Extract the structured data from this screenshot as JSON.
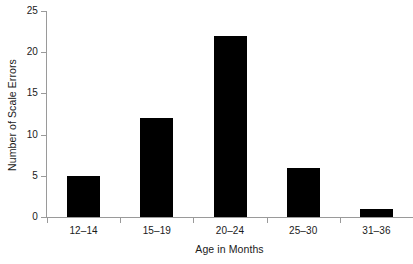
{
  "chart_data": {
    "type": "bar",
    "title": "",
    "xlabel": "Age in Months",
    "ylabel": "Number of Scale Errors",
    "categories": [
      "12–14",
      "15–19",
      "20–24",
      "25–30",
      "31–36"
    ],
    "values": [
      5,
      12,
      22,
      6,
      1
    ],
    "ylim": [
      0,
      25
    ],
    "yticks": [
      0,
      5,
      10,
      15,
      20,
      25
    ],
    "ytick_labels": [
      "0",
      "5",
      "10",
      "15",
      "20",
      "25"
    ],
    "grid": false,
    "legend": null,
    "bar_color": "#000000",
    "axis_color": "#9a9a9a",
    "text_color": "#1a1a1a",
    "background_color": "#ffffff"
  },
  "axes": {
    "x_title": "Age in Months",
    "y_title": "Number of Scale Errors"
  }
}
